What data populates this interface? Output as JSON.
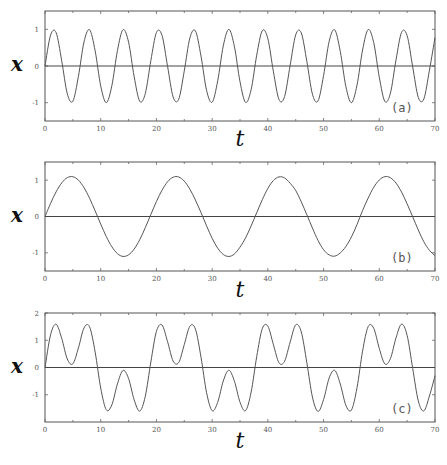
{
  "figure": {
    "width": 447,
    "height": 465,
    "line_color": "#555555",
    "background": "#ffffff"
  },
  "chart_data": [
    {
      "type": "line",
      "panel_label": "(a)",
      "xlabel": "t",
      "ylabel": "x",
      "xlim": [
        0,
        70
      ],
      "ylim": [
        -1.5,
        1.5
      ],
      "xticks": [
        0,
        10,
        20,
        30,
        40,
        50,
        60,
        70
      ],
      "yticks": [
        1,
        0,
        -1
      ],
      "zero_line": true,
      "grid": false,
      "layout": {
        "left": 45,
        "right": 435,
        "top": 11,
        "bottom": 121,
        "xlabel_y": 146,
        "ylabel_x": 17
      },
      "series": [
        {
          "name": "x(t) = sin(t)",
          "x": [
            0,
            1,
            2,
            3,
            4,
            5,
            6,
            7,
            8,
            9,
            10,
            11,
            12,
            13,
            14,
            15,
            16,
            17,
            18,
            19,
            20,
            21,
            22,
            23,
            24,
            25,
            26,
            27,
            28,
            29,
            30,
            31,
            32,
            33,
            34,
            35,
            36,
            37,
            38,
            39,
            40,
            41,
            42,
            43,
            44,
            45,
            46,
            47,
            48,
            49,
            50,
            51,
            52,
            53,
            54,
            55,
            56,
            57,
            58,
            59,
            60,
            61,
            62,
            63,
            64,
            65,
            66,
            67,
            68,
            69,
            70
          ],
          "values": [
            0,
            0.841,
            0.909,
            0.141,
            -0.757,
            -0.959,
            -0.279,
            0.657,
            0.989,
            0.412,
            -0.544,
            -1.0,
            -0.537,
            0.42,
            0.991,
            0.65,
            -0.288,
            -0.961,
            -0.751,
            0.15,
            0.913,
            0.837,
            -0.009,
            -0.846,
            -0.906,
            -0.132,
            0.763,
            0.956,
            0.271,
            -0.664,
            -0.988,
            -0.404,
            0.551,
            1.0,
            0.529,
            -0.428,
            -0.992,
            -0.644,
            0.296,
            0.964,
            0.745,
            -0.158,
            -0.917,
            -0.832,
            0.018,
            0.851,
            0.902,
            0.124,
            -0.768,
            -0.954,
            -0.262,
            0.67,
            0.987,
            0.396,
            -0.559,
            -1.0,
            -0.522,
            0.436,
            0.993,
            0.637,
            -0.305,
            -0.966,
            -0.739,
            0.167,
            0.92,
            0.827,
            -0.027,
            -0.856,
            -0.898,
            -0.115,
            0.774
          ]
        }
      ]
    },
    {
      "type": "line",
      "panel_label": "(b)",
      "xlabel": "t",
      "ylabel": "x",
      "xlim": [
        0,
        70
      ],
      "ylim": [
        -1.5,
        1.5
      ],
      "xticks": [
        0,
        10,
        20,
        30,
        40,
        50,
        60,
        70
      ],
      "yticks": [
        1,
        0,
        -1
      ],
      "zero_line": true,
      "grid": false,
      "layout": {
        "left": 45,
        "right": 435,
        "top": 162,
        "bottom": 271,
        "xlabel_y": 297,
        "ylabel_x": 17
      },
      "series": [
        {
          "name": "x(t) = 1.1 sin(t/3)",
          "x": [
            0,
            1,
            2,
            3,
            4,
            5,
            6,
            7,
            8,
            9,
            10,
            11,
            12,
            13,
            14,
            15,
            16,
            17,
            18,
            19,
            20,
            21,
            22,
            23,
            24,
            25,
            26,
            27,
            28,
            29,
            30,
            31,
            32,
            33,
            34,
            35,
            36,
            37,
            38,
            39,
            40,
            41,
            42,
            43,
            44,
            45,
            46,
            47,
            48,
            49,
            50,
            51,
            52,
            53,
            54,
            55,
            56,
            57,
            58,
            59,
            60,
            61,
            62,
            63,
            64,
            65,
            66,
            67,
            68,
            69,
            70
          ],
          "values": [
            0,
            0.36,
            0.68,
            0.926,
            1.069,
            1.095,
            1.0,
            0.795,
            0.503,
            0.155,
            -0.209,
            -0.552,
            -0.832,
            -1.022,
            -1.099,
            -1.055,
            -0.896,
            -0.64,
            -0.307,
            0.055,
            0.412,
            0.723,
            0.956,
            1.082,
            1.088,
            0.973,
            0.752,
            0.453,
            0.107,
            -0.257,
            -0.598,
            -0.871,
            -1.045,
            -1.1,
            -1.031,
            -0.844,
            -0.59,
            -0.258,
            0.103,
            0.462,
            0.773,
            0.992,
            1.09,
            1.061,
            0.915,
            0.715,
            0.402,
            0.048,
            -0.317,
            -0.657,
            -0.914,
            -1.057,
            -1.091,
            -1.002,
            -0.826,
            -0.562,
            -0.222,
            0.165,
            0.506,
            0.803,
            1.004,
            1.097,
            1.066,
            0.92,
            0.673,
            0.347,
            -0.01,
            -0.371,
            -0.696,
            -0.931,
            -1.076
          ]
        }
      ]
    },
    {
      "type": "line",
      "panel_label": "(c)",
      "xlabel": "t",
      "ylabel": "x",
      "xlim": [
        0,
        70
      ],
      "ylim": [
        -2,
        2
      ],
      "xticks": [
        0,
        10,
        20,
        30,
        40,
        50,
        60,
        70
      ],
      "yticks": [
        2,
        1,
        0,
        -1
      ],
      "zero_line": true,
      "grid": false,
      "layout": {
        "left": 45,
        "right": 435,
        "top": 313,
        "bottom": 422,
        "xlabel_y": 448,
        "ylabel_x": 17
      },
      "series": [
        {
          "name": "x(t) = sin(t) + 1.1 sin(t/3)",
          "x": [
            0,
            1,
            2,
            3,
            4,
            5,
            6,
            7,
            8,
            9,
            10,
            11,
            12,
            13,
            14,
            15,
            16,
            17,
            18,
            19,
            20,
            21,
            22,
            23,
            24,
            25,
            26,
            27,
            28,
            29,
            30,
            31,
            32,
            33,
            34,
            35,
            36,
            37,
            38,
            39,
            40,
            41,
            42,
            43,
            44,
            45,
            46,
            47,
            48,
            49,
            50,
            51,
            52,
            53,
            54,
            55,
            56,
            57,
            58,
            59,
            60,
            61,
            62,
            63,
            64,
            65,
            66,
            67,
            68,
            69,
            70
          ],
          "values": [
            0,
            1.201,
            1.589,
            1.067,
            0.312,
            0.136,
            0.721,
            1.452,
            1.492,
            0.567,
            -0.753,
            -1.552,
            -1.369,
            -0.602,
            -0.108,
            -0.405,
            -1.184,
            -1.601,
            -1.058,
            0.205,
            1.325,
            1.56,
            0.947,
            0.236,
            0.182,
            0.841,
            1.515,
            1.409,
            0.378,
            -0.921,
            -1.586,
            -1.275,
            -0.494,
            -0.1,
            -0.502,
            -1.272,
            -1.582,
            -0.902,
            0.399,
            1.426,
            1.518,
            0.834,
            0.173,
            0.229,
            0.933,
            1.566,
            1.304,
            0.172,
            -1.085,
            -1.611,
            -1.176,
            -0.387,
            -0.104,
            -0.606,
            -1.385,
            -1.562,
            -0.744,
            0.601,
            1.499,
            1.44,
            0.699,
            0.131,
            0.327,
            1.087,
            1.593,
            1.174,
            -0.037,
            -1.227,
            -1.594,
            -1.046,
            -0.302
          ]
        }
      ]
    }
  ]
}
